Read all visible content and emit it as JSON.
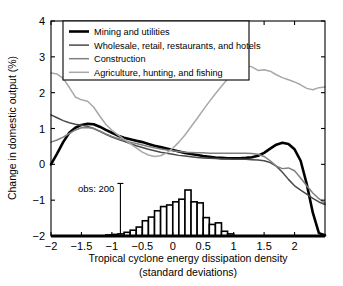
{
  "chart_data": {
    "type": "line",
    "title": "",
    "xlabel": "Tropical cyclone energy dissipation density (standard deviations)",
    "xlabel_line1": "Tropical cyclone energy dissipation density",
    "xlabel_line2": "(standard deviations)",
    "ylabel": "Change in domestic output (%)",
    "xlim": [
      -2,
      2.5
    ],
    "ylim": [
      -2,
      4
    ],
    "xticks": [
      -2,
      -1.5,
      -1,
      -0.5,
      0,
      0.5,
      1,
      1.5,
      2
    ],
    "xtick_labels": [
      "−2",
      "−1.5",
      "−1",
      "−0.5",
      "0",
      "0.5",
      "1",
      "1.5",
      "2"
    ],
    "yticks": [
      -2,
      -1,
      0,
      1,
      2,
      3,
      4
    ],
    "ytick_labels": [
      "−2",
      "−1",
      "0",
      "1",
      "2",
      "3",
      "4"
    ],
    "grid": false,
    "legend_position": "upper-left",
    "series": [
      {
        "name": "Mining and utilities",
        "color": "#000000",
        "width": 2.6,
        "x": [
          -2.0,
          -1.9,
          -1.8,
          -1.7,
          -1.6,
          -1.5,
          -1.4,
          -1.3,
          -1.2,
          -1.1,
          -1.0,
          -0.9,
          -0.8,
          -0.7,
          -0.6,
          -0.5,
          -0.4,
          -0.3,
          -0.2,
          -0.1,
          0.0,
          0.1,
          0.2,
          0.3,
          0.4,
          0.5,
          0.6,
          0.7,
          0.8,
          0.9,
          1.0,
          1.1,
          1.2,
          1.3,
          1.4,
          1.5,
          1.6,
          1.7,
          1.8,
          1.9,
          2.0,
          2.1,
          2.2,
          2.3,
          2.4,
          2.5
        ],
        "y": [
          0.0,
          0.3,
          0.62,
          0.88,
          1.02,
          1.1,
          1.13,
          1.12,
          1.05,
          0.96,
          0.88,
          0.8,
          0.74,
          0.7,
          0.66,
          0.62,
          0.57,
          0.52,
          0.48,
          0.44,
          0.4,
          0.36,
          0.32,
          0.29,
          0.26,
          0.23,
          0.21,
          0.19,
          0.18,
          0.17,
          0.17,
          0.17,
          0.18,
          0.2,
          0.24,
          0.32,
          0.44,
          0.55,
          0.6,
          0.57,
          0.42,
          0.1,
          -0.55,
          -1.35,
          -1.92,
          -1.98
        ]
      },
      {
        "name": "Wholesale, retail, restaurants, and hotels",
        "color": "#4a4a4a",
        "width": 1.5,
        "x": [
          -2.0,
          -1.9,
          -1.8,
          -1.7,
          -1.6,
          -1.5,
          -1.4,
          -1.3,
          -1.2,
          -1.1,
          -1.0,
          -0.9,
          -0.8,
          -0.7,
          -0.6,
          -0.5,
          -0.4,
          -0.3,
          -0.2,
          -0.1,
          0.0,
          0.1,
          0.2,
          0.3,
          0.4,
          0.5,
          0.6,
          0.7,
          0.8,
          0.9,
          1.0,
          1.1,
          1.2,
          1.3,
          1.4,
          1.5,
          1.6,
          1.7,
          1.8,
          1.9,
          2.0,
          2.1,
          2.2,
          2.3,
          2.4,
          2.5
        ],
        "y": [
          1.38,
          1.3,
          1.22,
          1.16,
          1.12,
          1.09,
          1.06,
          1.0,
          0.92,
          0.84,
          0.76,
          0.7,
          0.64,
          0.58,
          0.52,
          0.47,
          0.42,
          0.38,
          0.34,
          0.31,
          0.28,
          0.25,
          0.23,
          0.21,
          0.19,
          0.18,
          0.17,
          0.16,
          0.15,
          0.15,
          0.14,
          0.14,
          0.14,
          0.13,
          0.12,
          0.1,
          0.05,
          -0.05,
          -0.22,
          -0.42,
          -0.6,
          -0.72,
          -0.83,
          -0.95,
          -1.05,
          -1.12
        ]
      },
      {
        "name": "Construction",
        "color": "#808080",
        "width": 1.5,
        "x": [
          -2.0,
          -1.9,
          -1.8,
          -1.7,
          -1.6,
          -1.5,
          -1.4,
          -1.3,
          -1.2,
          -1.1,
          -1.0,
          -0.9,
          -0.8,
          -0.7,
          -0.6,
          -0.5,
          -0.4,
          -0.3,
          -0.2,
          -0.1,
          0.0,
          0.1,
          0.2,
          0.3,
          0.4,
          0.5,
          0.6,
          0.7,
          0.8,
          0.9,
          1.0,
          1.1,
          1.2,
          1.3,
          1.4,
          1.5,
          1.6,
          1.7,
          1.8,
          1.9,
          2.0,
          2.1,
          2.2,
          2.3,
          2.4,
          2.5
        ],
        "y": [
          0.62,
          0.68,
          0.76,
          0.86,
          0.96,
          1.02,
          1.03,
          1.0,
          0.93,
          0.85,
          0.78,
          0.72,
          0.67,
          0.62,
          0.58,
          0.54,
          0.5,
          0.46,
          0.43,
          0.4,
          0.38,
          0.36,
          0.34,
          0.33,
          0.32,
          0.32,
          0.31,
          0.31,
          0.31,
          0.31,
          0.31,
          0.31,
          0.31,
          0.3,
          0.28,
          0.22,
          0.1,
          -0.05,
          -0.12,
          -0.1,
          -0.18,
          -0.38,
          -0.6,
          -0.8,
          -0.96,
          -1.08
        ]
      },
      {
        "name": "Agriculture, hunting, and fishing",
        "color": "#a8a8a8",
        "width": 1.5,
        "x": [
          -2.0,
          -1.9,
          -1.8,
          -1.7,
          -1.6,
          -1.5,
          -1.4,
          -1.3,
          -1.2,
          -1.1,
          -1.0,
          -0.9,
          -0.8,
          -0.7,
          -0.6,
          -0.5,
          -0.4,
          -0.3,
          -0.2,
          -0.1,
          0.0,
          0.1,
          0.2,
          0.3,
          0.4,
          0.5,
          0.6,
          0.7,
          0.8,
          0.9,
          1.0,
          1.1,
          1.2,
          1.3,
          1.4,
          1.5,
          1.6,
          1.7,
          1.8,
          1.9,
          2.0,
          2.1,
          2.2,
          2.3,
          2.4,
          2.5
        ],
        "y": [
          2.55,
          2.52,
          2.4,
          2.15,
          1.88,
          1.8,
          1.76,
          1.6,
          1.35,
          1.12,
          0.95,
          0.82,
          0.7,
          0.58,
          0.46,
          0.34,
          0.26,
          0.22,
          0.24,
          0.32,
          0.45,
          0.62,
          0.82,
          1.05,
          1.28,
          1.52,
          1.75,
          1.97,
          2.18,
          2.38,
          2.55,
          2.68,
          2.76,
          2.72,
          2.62,
          2.64,
          2.6,
          2.5,
          2.42,
          2.36,
          2.3,
          2.22,
          2.12,
          2.08,
          2.14,
          2.16
        ]
      }
    ],
    "histogram": {
      "label": "obs: 200",
      "scale_value": 200,
      "bin_width": 0.1,
      "baseline": -2,
      "bins": [
        {
          "x": -1.05,
          "count": 4
        },
        {
          "x": -0.95,
          "count": 6
        },
        {
          "x": -0.85,
          "count": 8
        },
        {
          "x": -0.75,
          "count": 14
        },
        {
          "x": -0.65,
          "count": 22
        },
        {
          "x": -0.55,
          "count": 34
        },
        {
          "x": -0.45,
          "count": 58
        },
        {
          "x": -0.35,
          "count": 72
        },
        {
          "x": -0.25,
          "count": 96
        },
        {
          "x": -0.15,
          "count": 112
        },
        {
          "x": -0.05,
          "count": 118
        },
        {
          "x": 0.05,
          "count": 130
        },
        {
          "x": 0.15,
          "count": 140
        },
        {
          "x": 0.25,
          "count": 175
        },
        {
          "x": 0.35,
          "count": 130
        },
        {
          "x": 0.45,
          "count": 126
        },
        {
          "x": 0.55,
          "count": 70
        },
        {
          "x": 0.65,
          "count": 44
        },
        {
          "x": 0.75,
          "count": 50
        },
        {
          "x": 0.85,
          "count": 18
        },
        {
          "x": 0.95,
          "count": 8
        }
      ]
    }
  }
}
